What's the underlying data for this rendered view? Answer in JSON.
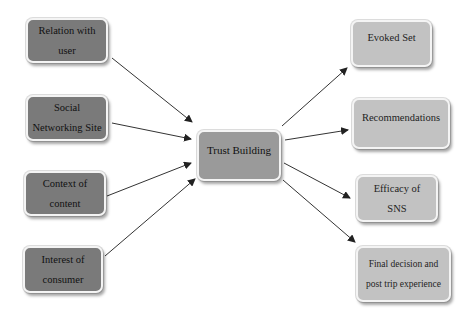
{
  "diagram": {
    "inputs": [
      {
        "id": "relation",
        "lines": [
          "Relation with",
          "user"
        ]
      },
      {
        "id": "sns",
        "lines": [
          "Social",
          "Networking Site"
        ]
      },
      {
        "id": "context",
        "lines": [
          "Context of",
          "content"
        ]
      },
      {
        "id": "interest",
        "lines": [
          "Interest of",
          "consumer"
        ]
      }
    ],
    "center": {
      "id": "trust",
      "lines": [
        "Trust Building"
      ]
    },
    "outputs": [
      {
        "id": "evoked",
        "lines": [
          "Evoked Set"
        ]
      },
      {
        "id": "recommendations",
        "lines": [
          "Recommendations"
        ]
      },
      {
        "id": "efficacy",
        "lines": [
          "Efficacy of",
          "SNS"
        ]
      },
      {
        "id": "final",
        "lines": [
          "Final decision and",
          "post trip experience"
        ]
      }
    ],
    "edges": [
      {
        "from": "relation",
        "to": "trust"
      },
      {
        "from": "sns",
        "to": "trust"
      },
      {
        "from": "context",
        "to": "trust"
      },
      {
        "from": "interest",
        "to": "trust"
      },
      {
        "from": "trust",
        "to": "evoked"
      },
      {
        "from": "trust",
        "to": "recommendations"
      },
      {
        "from": "trust",
        "to": "efficacy"
      },
      {
        "from": "trust",
        "to": "final"
      }
    ]
  }
}
